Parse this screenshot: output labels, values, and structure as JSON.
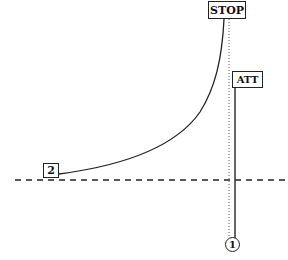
{
  "diagram": {
    "labels": {
      "stop": "STOP",
      "att": "ATT",
      "point_2": "2",
      "point_1": "1"
    },
    "elements": {
      "baseline": {
        "style": "dashed",
        "orientation": "horizontal"
      },
      "stop_line": {
        "style": "dotted",
        "orientation": "vertical"
      },
      "att_line": {
        "style": "solid",
        "orientation": "vertical"
      },
      "curve": {
        "style": "solid",
        "from": "2",
        "to": "STOP"
      }
    },
    "colors": {
      "stroke": "#222222",
      "background": "#ffffff"
    }
  }
}
